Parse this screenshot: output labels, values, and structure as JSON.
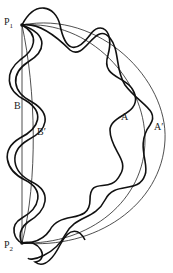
{
  "diagram": {
    "points": [
      {
        "id": "P1",
        "label": "P",
        "sub": "1",
        "x": 22,
        "y": 25
      },
      {
        "id": "P2",
        "label": "P",
        "sub": "2",
        "x": 22,
        "y": 243
      }
    ],
    "path_labels": [
      {
        "id": "A",
        "text": "A"
      },
      {
        "id": "A_prime",
        "text": "A′"
      },
      {
        "id": "B",
        "text": "B"
      },
      {
        "id": "B_prime",
        "text": "B′"
      }
    ],
    "colors": {
      "stroke": "#111111",
      "background": "#ffffff"
    }
  }
}
